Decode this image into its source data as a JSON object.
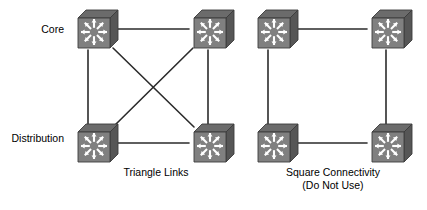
{
  "diagram": {
    "colors": {
      "background": "#ffffff",
      "link": "#2b2b2b",
      "device_front": "#808080",
      "device_top": "#6b6b6b",
      "device_side": "#565656",
      "device_arrow": "#ffffff",
      "device_outline": "#3c3c3c",
      "text": "#000000"
    },
    "row_labels": [
      {
        "id": "core",
        "text": "Core",
        "x": 26,
        "y": 29
      },
      {
        "id": "distribution",
        "text": "Distribution",
        "x": 10,
        "y": 138
      }
    ],
    "captions": [
      {
        "id": "triangle-links",
        "lines": [
          "Triangle Links"
        ],
        "center_x": 156,
        "y": 172
      },
      {
        "id": "square-connectivity",
        "lines": [
          "Square Connectivity",
          "(Do Not Use)"
        ],
        "center_x": 333,
        "y": 172
      }
    ],
    "groups": [
      {
        "id": "triangle",
        "name": "Triangle Links",
        "caption": "Triangle Links",
        "note": "",
        "devices": [
          {
            "id": "tri-core-left",
            "role": "core",
            "icon": "multilayer-switch-icon",
            "x": 72,
            "y": 6
          },
          {
            "id": "tri-core-right",
            "role": "core",
            "icon": "multilayer-switch-icon",
            "x": 188,
            "y": 6
          },
          {
            "id": "tri-dist-left",
            "role": "distribution",
            "icon": "multilayer-switch-icon",
            "x": 72,
            "y": 120
          },
          {
            "id": "tri-dist-right",
            "role": "distribution",
            "icon": "multilayer-switch-icon",
            "x": 188,
            "y": 120
          }
        ],
        "links": [
          {
            "id": "tri-top",
            "from": "tri-core-left",
            "to": "tri-core-right",
            "kind": "horizontal"
          },
          {
            "id": "tri-left",
            "from": "tri-core-left",
            "to": "tri-dist-left",
            "kind": "vertical"
          },
          {
            "id": "tri-right",
            "from": "tri-core-right",
            "to": "tri-dist-right",
            "kind": "vertical"
          },
          {
            "id": "tri-bottom",
            "from": "tri-dist-left",
            "to": "tri-dist-right",
            "kind": "horizontal"
          },
          {
            "id": "tri-diag-1",
            "from": "tri-core-left",
            "to": "tri-dist-right",
            "kind": "diagonal"
          },
          {
            "id": "tri-diag-2",
            "from": "tri-core-right",
            "to": "tri-dist-left",
            "kind": "diagonal"
          }
        ]
      },
      {
        "id": "square",
        "name": "Square Connectivity",
        "caption": "Square Connectivity",
        "note": "(Do Not Use)",
        "devices": [
          {
            "id": "sq-core-left",
            "role": "core",
            "icon": "multilayer-switch-icon",
            "x": 252,
            "y": 6
          },
          {
            "id": "sq-core-right",
            "role": "core",
            "icon": "multilayer-switch-icon",
            "x": 366,
            "y": 6
          },
          {
            "id": "sq-dist-left",
            "role": "distribution",
            "icon": "multilayer-switch-icon",
            "x": 252,
            "y": 120
          },
          {
            "id": "sq-dist-right",
            "role": "distribution",
            "icon": "multilayer-switch-icon",
            "x": 366,
            "y": 120
          }
        ],
        "links": [
          {
            "id": "sq-top",
            "from": "sq-core-left",
            "to": "sq-core-right",
            "kind": "horizontal"
          },
          {
            "id": "sq-left",
            "from": "sq-core-left",
            "to": "sq-dist-left",
            "kind": "vertical"
          },
          {
            "id": "sq-right",
            "from": "sq-core-right",
            "to": "sq-dist-right",
            "kind": "vertical"
          },
          {
            "id": "sq-bottom",
            "from": "sq-dist-left",
            "to": "sq-dist-right",
            "kind": "horizontal"
          }
        ]
      }
    ],
    "link_geometry": [
      {
        "id": "tri-top",
        "x1": 117,
        "y1": 29,
        "x2": 189,
        "y2": 29
      },
      {
        "id": "tri-left",
        "x1": 88,
        "y1": 50,
        "x2": 88,
        "y2": 124
      },
      {
        "id": "tri-right",
        "x1": 208,
        "y1": 50,
        "x2": 208,
        "y2": 124
      },
      {
        "id": "tri-bottom",
        "x1": 117,
        "y1": 143,
        "x2": 189,
        "y2": 143
      },
      {
        "id": "tri-diag-1",
        "x1": 113,
        "y1": 48,
        "x2": 194,
        "y2": 127
      },
      {
        "id": "tri-diag-2",
        "x1": 193,
        "y1": 48,
        "x2": 113,
        "y2": 127
      },
      {
        "id": "sq-top",
        "x1": 297,
        "y1": 29,
        "x2": 367,
        "y2": 29
      },
      {
        "id": "sq-left",
        "x1": 268,
        "y1": 50,
        "x2": 268,
        "y2": 124
      },
      {
        "id": "sq-right",
        "x1": 386,
        "y1": 50,
        "x2": 386,
        "y2": 124
      },
      {
        "id": "sq-bottom",
        "x1": 297,
        "y1": 143,
        "x2": 367,
        "y2": 143
      }
    ]
  }
}
